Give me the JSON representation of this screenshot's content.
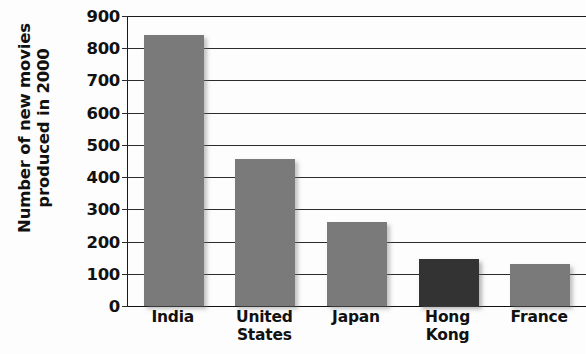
{
  "chart_data": {
    "type": "bar",
    "title": "",
    "xlabel": "",
    "ylabel": "Number of new movies produced in 2000",
    "ylabel_lines": [
      "Number of new movies",
      "produced in 2000"
    ],
    "categories": [
      "India",
      "United States",
      "Japan",
      "Hong Kong",
      "France"
    ],
    "category_lines": [
      [
        "India"
      ],
      [
        "United",
        "States"
      ],
      [
        "Japan"
      ],
      [
        "Hong",
        "Kong"
      ],
      [
        "France"
      ]
    ],
    "values": [
      840,
      455,
      260,
      145,
      130
    ],
    "ylim": [
      0,
      900
    ],
    "ytick_step": 100,
    "yticks": [
      "900",
      "800",
      "700",
      "600",
      "500",
      "400",
      "300",
      "200",
      "100",
      "0"
    ],
    "grid": true,
    "legend": "none",
    "bar_colors": [
      "#7a7a7a",
      "#7a7a7a",
      "#7a7a7a",
      "#333333",
      "#7a7a7a"
    ],
    "default_bar_color": "#7a7a7a",
    "highlight_bar_color": "#333333",
    "axis_color": "#1a1a1a",
    "background_color": "#fdfdfd"
  }
}
